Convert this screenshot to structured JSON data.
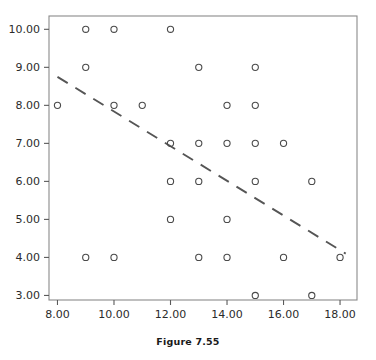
{
  "caption": "Figure 7.55",
  "colors": {
    "frame": "#8a8a8a",
    "axis": "#5a5a5a",
    "marker": "#4a4a4a",
    "trendline": "#555555",
    "text": "#2b2b2b",
    "background": "#ffffff"
  },
  "axes": {
    "x": {
      "min": 7.7,
      "max": 18.6,
      "ticks": [
        8,
        10,
        12,
        14,
        16,
        18
      ],
      "tick_labels": [
        "8.00",
        "10.00",
        "12.00",
        "14.00",
        "16.00",
        "18.00"
      ]
    },
    "y": {
      "min": 2.88,
      "max": 10.35,
      "ticks": [
        3,
        4,
        5,
        6,
        7,
        8,
        9,
        10
      ],
      "tick_labels": [
        "3.00",
        "4.00",
        "5.00",
        "6.00",
        "7.00",
        "8.00",
        "9.00",
        "10.00"
      ]
    }
  },
  "chart_data": {
    "type": "scatter",
    "title": "",
    "xlabel": "",
    "ylabel": "",
    "xlim": [
      7.7,
      18.6
    ],
    "ylim": [
      2.88,
      10.35
    ],
    "grid": false,
    "legend": null,
    "marker": {
      "shape": "circle",
      "filled": false,
      "radius": 3.1,
      "edge_color": "#4a4a4a"
    },
    "points": [
      {
        "x": 9,
        "y": 10
      },
      {
        "x": 10,
        "y": 10
      },
      {
        "x": 12,
        "y": 10
      },
      {
        "x": 9,
        "y": 9
      },
      {
        "x": 13,
        "y": 9
      },
      {
        "x": 15,
        "y": 9
      },
      {
        "x": 8,
        "y": 8
      },
      {
        "x": 10,
        "y": 8
      },
      {
        "x": 11,
        "y": 8
      },
      {
        "x": 14,
        "y": 8
      },
      {
        "x": 15,
        "y": 8
      },
      {
        "x": 12,
        "y": 7
      },
      {
        "x": 13,
        "y": 7
      },
      {
        "x": 14,
        "y": 7
      },
      {
        "x": 15,
        "y": 7
      },
      {
        "x": 16,
        "y": 7
      },
      {
        "x": 12,
        "y": 6
      },
      {
        "x": 13,
        "y": 6
      },
      {
        "x": 15,
        "y": 6
      },
      {
        "x": 17,
        "y": 6
      },
      {
        "x": 12,
        "y": 5
      },
      {
        "x": 14,
        "y": 5
      },
      {
        "x": 9,
        "y": 4
      },
      {
        "x": 10,
        "y": 4
      },
      {
        "x": 13,
        "y": 4
      },
      {
        "x": 14,
        "y": 4
      },
      {
        "x": 16,
        "y": 4
      },
      {
        "x": 18,
        "y": 4
      },
      {
        "x": 15,
        "y": 3
      },
      {
        "x": 17,
        "y": 3
      }
    ],
    "trendline": {
      "style": "dashed",
      "x_start": 8.0,
      "y_start": 8.75,
      "x_end": 18.2,
      "y_end": 4.1
    }
  }
}
